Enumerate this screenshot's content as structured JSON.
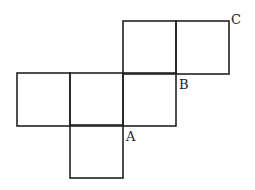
{
  "diagram": {
    "stroke_color": "#222222",
    "squares": [
      {
        "id": "top-left",
        "x": 123,
        "y": 21
      },
      {
        "id": "top-right",
        "x": 176,
        "y": 21
      },
      {
        "id": "mid-1",
        "x": 17,
        "y": 73
      },
      {
        "id": "mid-2",
        "x": 70,
        "y": 73
      },
      {
        "id": "mid-3",
        "x": 123,
        "y": 73
      },
      {
        "id": "bottom",
        "x": 70,
        "y": 125
      }
    ],
    "square_size": 53,
    "labels": {
      "a": "A",
      "b": "B",
      "c": "C"
    }
  }
}
